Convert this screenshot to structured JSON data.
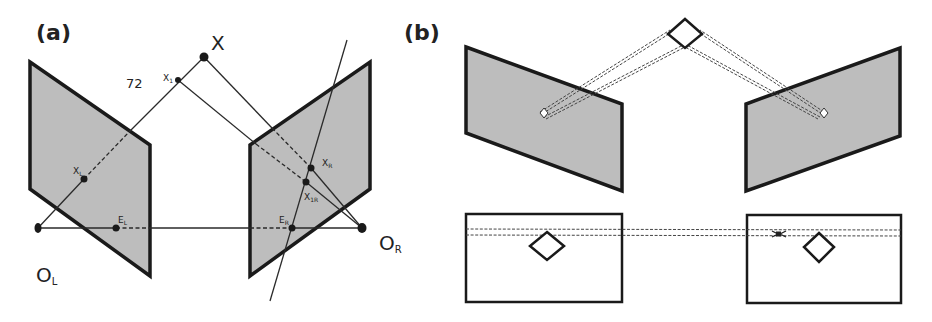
{
  "figure": {
    "panel_a": {
      "label": "(a)",
      "points": {
        "X": "X",
        "X1": "X",
        "X1_sub": "1",
        "XL": "X",
        "XL_sub": "L",
        "XR": "X",
        "XR_sub": "R",
        "X1R": "X",
        "X1R_sub": "1R",
        "EL": "E",
        "EL_sub": "L",
        "ER": "E",
        "ER_sub": "R",
        "OL": "O",
        "OL_sub": "L",
        "OR": "O",
        "OR_sub": "R"
      },
      "annotation": "72"
    },
    "panel_b": {
      "label": "(b)"
    },
    "colors": {
      "plane_fill": "#bdbdbd",
      "stroke": "#1a1a1a",
      "background": "#ffffff"
    }
  }
}
